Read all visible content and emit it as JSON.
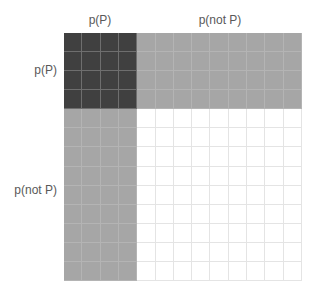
{
  "labels": {
    "col_p": "p(P)",
    "col_not_p": "p(not P)",
    "row_p": "p(P)",
    "row_not_p": "p(not P)"
  },
  "grid": {
    "columns": 13,
    "rows": 13,
    "p_cells": 4,
    "colors": {
      "both_p": "#404040",
      "one_p": "#a6a6a6",
      "neither": "#ffffff",
      "line_dark": "#6e6e6e",
      "line_gray": "#b4b4b4",
      "line_white": "#e4e4e4"
    }
  }
}
